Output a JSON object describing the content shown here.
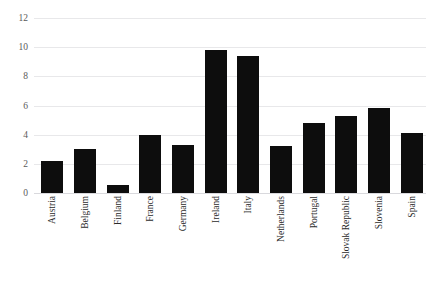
{
  "chart_data": {
    "type": "bar",
    "title": "",
    "subtitle": "",
    "xlabel": "",
    "ylabel": "",
    "ylim": [
      0,
      12
    ],
    "ytick_values": [
      12,
      10,
      8,
      6,
      4,
      2,
      0
    ],
    "ytick_labels": [
      "12",
      "10",
      "8",
      "6",
      "4",
      "2",
      "0"
    ],
    "grid": "horizontal",
    "legend": null,
    "bar_color": "#0d0d0d",
    "gridline_color": "#e8e8ea",
    "categories": [
      "Austria",
      "Belgium",
      "Finland",
      "France",
      "Germany",
      "Ireland",
      "Italy",
      "Netherlands",
      "Portugal",
      "Slovak Republic",
      "Slovenia",
      "Spain"
    ],
    "values": [
      2.2,
      3.05,
      0.55,
      4.0,
      3.3,
      9.8,
      9.4,
      3.25,
      4.8,
      5.3,
      5.85,
      4.1
    ]
  }
}
